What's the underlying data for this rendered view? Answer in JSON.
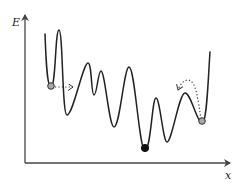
{
  "diagram": {
    "type": "energy-landscape",
    "axes": {
      "y_label": "E",
      "x_label": "x"
    },
    "colors": {
      "line": "#222222",
      "axis": "#444444",
      "ball_gray": "#a8a8a8",
      "ball_black": "#111111"
    },
    "balls": [
      {
        "name": "local-minimum-ball-left",
        "fill": "gray"
      },
      {
        "name": "global-minimum-ball",
        "fill": "black"
      },
      {
        "name": "local-minimum-ball-right",
        "fill": "gray"
      }
    ],
    "arrows": [
      {
        "name": "tunneling-arrow",
        "style": "dotted",
        "description": "horizontal dotted arrow through barrier from left well"
      },
      {
        "name": "thermal-hop-arrow",
        "style": "dotted",
        "description": "dotted arc over barrier from right well"
      }
    ]
  }
}
